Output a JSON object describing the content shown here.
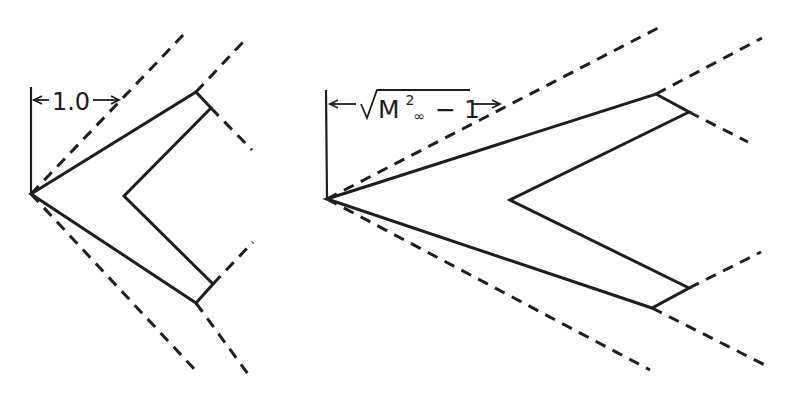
{
  "figure": {
    "ink_color": "#1e1e1e",
    "background": "#ffffff"
  },
  "left_wing": {
    "dimension_label": "1.0",
    "apex": [
      31,
      194
    ],
    "outline": [
      [
        31,
        194
      ],
      [
        196,
        92
      ],
      [
        211,
        108
      ],
      [
        124,
        196
      ],
      [
        213,
        284
      ],
      [
        196,
        303
      ],
      [
        31,
        194
      ]
    ],
    "reference_line": [
      [
        31,
        87
      ],
      [
        31,
        194
      ]
    ],
    "dimension_arrow": {
      "from": [
        31,
        100
      ],
      "to": [
        120,
        100
      ],
      "label_x": 66,
      "label_y": 111
    },
    "mach_lines": [
      [
        [
          31,
          194
        ],
        [
          185,
          33
        ]
      ],
      [
        [
          196,
          92
        ],
        [
          245,
          40
        ]
      ],
      [
        [
          211,
          108
        ],
        [
          252,
          150
        ]
      ],
      [
        [
          31,
          194
        ],
        [
          197,
          372
        ]
      ],
      [
        [
          196,
          303
        ],
        [
          248,
          374
        ]
      ],
      [
        [
          213,
          284
        ],
        [
          253,
          242
        ]
      ]
    ]
  },
  "right_wing": {
    "dimension_label": {
      "root": "√",
      "base": "M",
      "superscript": "2",
      "subscript": "∞",
      "tail": " − 1"
    },
    "apex": [
      327,
      199
    ],
    "outline": [
      [
        327,
        199
      ],
      [
        656,
        94
      ],
      [
        689,
        112
      ],
      [
        510,
        200
      ],
      [
        689,
        288
      ],
      [
        652,
        308
      ],
      [
        327,
        199
      ]
    ],
    "reference_line": [
      [
        326,
        90
      ],
      [
        327,
        199
      ]
    ],
    "dimension_arrow": {
      "from": [
        327,
        104
      ],
      "to": [
        500,
        104
      ]
    },
    "mach_lines": [
      [
        [
          327,
          199
        ],
        [
          658,
          28
        ]
      ],
      [
        [
          656,
          94
        ],
        [
          762,
          38
        ]
      ],
      [
        [
          689,
          112
        ],
        [
          748,
          142
        ]
      ],
      [
        [
          327,
          199
        ],
        [
          650,
          370
        ]
      ],
      [
        [
          652,
          308
        ],
        [
          765,
          365
        ]
      ],
      [
        [
          689,
          288
        ],
        [
          761,
          252
        ]
      ]
    ]
  }
}
